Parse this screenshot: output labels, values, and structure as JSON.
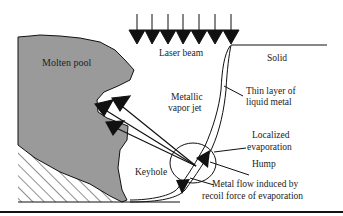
{
  "diagram": {
    "labels": {
      "molten_pool": "Molten pool",
      "laser_beam": "Laser beam",
      "solid": "Solid",
      "thin_layer_1": "Thin layer of",
      "thin_layer_2": "liquid metal",
      "vapor_jet_1": "Metallic",
      "vapor_jet_2": "vapor jet",
      "localized_1": "Localized",
      "localized_2": "evaporation",
      "hump": "Hump",
      "keyhole": "Keyhole",
      "metal_flow_1": "Metal flow induced by",
      "metal_flow_2": "recoil force of evaporation"
    },
    "colors": {
      "molten_pool_fill": "#9a9a9a",
      "line": "#111111",
      "background": "#ffffff"
    }
  }
}
